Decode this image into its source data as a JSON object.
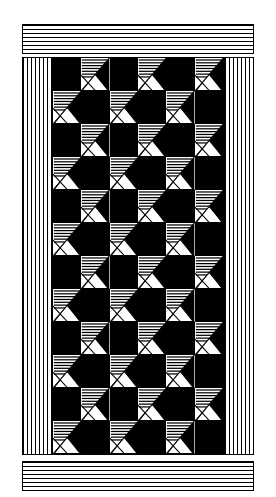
{
  "artwork": {
    "title": "Pieced Quilt Pattern",
    "description": "Black and white patchwork quilt with striped borders and a checkerboard field of alternating solid and hatched pinwheel blocks",
    "canvas": {
      "width": 276,
      "height": 497
    },
    "colors": {
      "ink": "#000000",
      "ground": "#ffffff"
    }
  },
  "borders": {
    "top": {
      "name": "top-striped-border",
      "orientation": "horizontal",
      "x": 22,
      "y": 24,
      "width": 232,
      "height": 30,
      "stripe_count": 8,
      "stripe_period_px": 4
    },
    "bottom": {
      "name": "bottom-striped-border",
      "orientation": "horizontal",
      "x": 22,
      "y": 461,
      "width": 232,
      "height": 30,
      "stripe_count": 8,
      "stripe_period_px": 4
    },
    "left": {
      "name": "left-striped-border",
      "orientation": "vertical",
      "x": 22,
      "y": 57,
      "width": 30,
      "height": 398,
      "stripe_count": 8,
      "stripe_period_px": 4
    },
    "right": {
      "name": "right-striped-border",
      "orientation": "vertical",
      "x": 224,
      "y": 57,
      "width": 30,
      "height": 398,
      "stripe_count": 8,
      "stripe_period_px": 4
    }
  },
  "field": {
    "name": "quilt-field",
    "x": 52,
    "y": 57,
    "width": 172,
    "height": 398,
    "columns": 6,
    "rows": 12,
    "cell_width": 28.6,
    "cell_height": 33.2,
    "block_types": {
      "solid": "solid-black-block",
      "pattern": "hatched-pinwheel-block"
    },
    "layout": [
      [
        "solid",
        "pattern",
        "solid",
        "pattern",
        "solid",
        "pattern"
      ],
      [
        "pattern",
        "solid",
        "pattern",
        "solid",
        "pattern",
        "solid"
      ],
      [
        "solid",
        "pattern",
        "solid",
        "pattern",
        "solid",
        "pattern"
      ],
      [
        "pattern",
        "solid",
        "pattern",
        "solid",
        "pattern",
        "solid"
      ],
      [
        "solid",
        "pattern",
        "solid",
        "pattern",
        "solid",
        "pattern"
      ],
      [
        "pattern",
        "solid",
        "pattern",
        "solid",
        "pattern",
        "solid"
      ],
      [
        "solid",
        "pattern",
        "solid",
        "pattern",
        "solid",
        "pattern"
      ],
      [
        "pattern",
        "solid",
        "pattern",
        "solid",
        "pattern",
        "solid"
      ],
      [
        "solid",
        "pattern",
        "solid",
        "pattern",
        "solid",
        "pattern"
      ],
      [
        "pattern",
        "solid",
        "pattern",
        "solid",
        "pattern",
        "solid"
      ],
      [
        "solid",
        "pattern",
        "solid",
        "pattern",
        "solid",
        "pattern"
      ],
      [
        "pattern",
        "solid",
        "pattern",
        "solid",
        "pattern",
        "solid"
      ]
    ]
  },
  "pattern_block": {
    "name": "hatched-pinwheel-block",
    "hatch_line_count": 7,
    "hatch_orientation": "horizontal",
    "hatch_region": "upper-left-triangle",
    "diagonals": [
      "top-right-to-bottom-left",
      "top-left-to-bottom-right-partial"
    ],
    "solid_wedge": "right-edge-triangle",
    "notes": "Upper-left half filled with horizontal hatch lines; a diagonal from the top-right corner descends to the lower-left; a black wedge occupies the right side; a white triangle sits at the bottom center."
  }
}
